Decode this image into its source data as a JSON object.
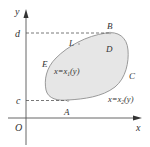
{
  "diagram": {
    "type": "double-integral-region",
    "colors": {
      "region_fill": "#e6e6e6",
      "region_stroke": "#9a9a9a",
      "axis": "#555555",
      "dashed": "#555555",
      "text": "#333333",
      "point": "#b0b0b0"
    },
    "axes": {
      "x_label": "x",
      "y_label": "y",
      "origin_label": "O"
    },
    "bounds": {
      "lower_label": "c",
      "upper_label": "d"
    },
    "points": {
      "A": "A",
      "B": "B",
      "C": "C",
      "E": "E",
      "L": "L"
    },
    "region_label": "D",
    "curves": {
      "left": {
        "lhs": "x=x",
        "sub": "1",
        "rhs": "(y)"
      },
      "right": {
        "lhs": "x=x",
        "sub": "2",
        "rhs": "(y)"
      }
    }
  }
}
